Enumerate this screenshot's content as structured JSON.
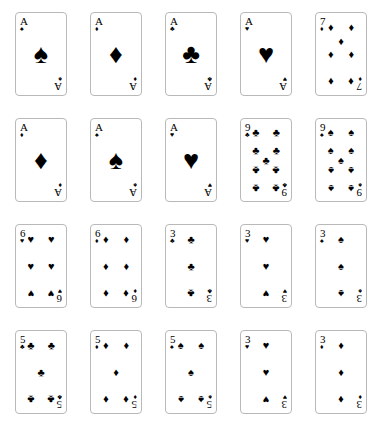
{
  "page": {
    "background_color": "#ffffff",
    "card_face_color": "#ffffff",
    "card_border_color": "#b9b9b9",
    "ink_color": "#000000",
    "rows": 4,
    "columns": 5,
    "card_count": 20
  },
  "suit_glyphs": {
    "spades": "♠",
    "hearts": "♥",
    "diamonds": "♦",
    "clubs": "♣"
  },
  "cards": [
    {
      "id": "r1c1",
      "rank": "A",
      "suit": "spades",
      "suit_glyph": "♠",
      "pip_layout": "ace",
      "row": 1,
      "column": 1
    },
    {
      "id": "r1c2",
      "rank": "A",
      "suit": "diamonds",
      "suit_glyph": "♦",
      "pip_layout": "ace",
      "row": 1,
      "column": 2
    },
    {
      "id": "r1c3",
      "rank": "A",
      "suit": "clubs",
      "suit_glyph": "♣",
      "pip_layout": "ace",
      "row": 1,
      "column": 3
    },
    {
      "id": "r1c4",
      "rank": "A",
      "suit": "hearts",
      "suit_glyph": "♥",
      "pip_layout": "ace",
      "row": 1,
      "column": 4
    },
    {
      "id": "r1c5",
      "rank": "7",
      "suit": "diamonds",
      "suit_glyph": "♦",
      "pip_layout": "seven",
      "row": 1,
      "column": 5
    },
    {
      "id": "r2c1",
      "rank": "A",
      "suit": "diamonds",
      "suit_glyph": "♦",
      "pip_layout": "ace",
      "row": 2,
      "column": 1
    },
    {
      "id": "r2c2",
      "rank": "A",
      "suit": "spades",
      "suit_glyph": "♠",
      "pip_layout": "ace",
      "row": 2,
      "column": 2
    },
    {
      "id": "r2c3",
      "rank": "A",
      "suit": "hearts",
      "suit_glyph": "♥",
      "pip_layout": "ace",
      "row": 2,
      "column": 3
    },
    {
      "id": "r2c4",
      "rank": "9",
      "suit": "clubs",
      "suit_glyph": "♣",
      "pip_layout": "nine",
      "row": 2,
      "column": 4
    },
    {
      "id": "r2c5",
      "rank": "9",
      "suit": "spades",
      "suit_glyph": "♠",
      "pip_layout": "nine",
      "row": 2,
      "column": 5
    },
    {
      "id": "r3c1",
      "rank": "6",
      "suit": "hearts",
      "suit_glyph": "♥",
      "pip_layout": "six",
      "row": 3,
      "column": 1
    },
    {
      "id": "r3c2",
      "rank": "6",
      "suit": "diamonds",
      "suit_glyph": "♦",
      "pip_layout": "six",
      "row": 3,
      "column": 2
    },
    {
      "id": "r3c3",
      "rank": "3",
      "suit": "clubs",
      "suit_glyph": "♣",
      "pip_layout": "three",
      "row": 3,
      "column": 3
    },
    {
      "id": "r3c4",
      "rank": "3",
      "suit": "hearts",
      "suit_glyph": "♥",
      "pip_layout": "three",
      "row": 3,
      "column": 4
    },
    {
      "id": "r3c5",
      "rank": "3",
      "suit": "spades",
      "suit_glyph": "♠",
      "pip_layout": "three",
      "row": 3,
      "column": 5
    },
    {
      "id": "r4c1",
      "rank": "5",
      "suit": "clubs",
      "suit_glyph": "♣",
      "pip_layout": "five",
      "row": 4,
      "column": 1
    },
    {
      "id": "r4c2",
      "rank": "5",
      "suit": "diamonds",
      "suit_glyph": "♦",
      "pip_layout": "five",
      "row": 4,
      "column": 2
    },
    {
      "id": "r4c3",
      "rank": "5",
      "suit": "spades",
      "suit_glyph": "♠",
      "pip_layout": "five",
      "row": 4,
      "column": 3
    },
    {
      "id": "r4c4",
      "rank": "3",
      "suit": "hearts",
      "suit_glyph": "♥",
      "pip_layout": "three",
      "row": 4,
      "column": 4
    },
    {
      "id": "r4c5",
      "rank": "3",
      "suit": "diamonds",
      "suit_glyph": "♦",
      "pip_layout": "three",
      "row": 4,
      "column": 5
    }
  ],
  "pip_layouts": {
    "ace": [
      {
        "x": 50,
        "y": 50,
        "size": "big",
        "flip": false
      }
    ],
    "three": [
      {
        "x": 50,
        "y": 8,
        "flip": false
      },
      {
        "x": 50,
        "y": 50,
        "flip": false
      },
      {
        "x": 50,
        "y": 92,
        "flip": true
      }
    ],
    "five": [
      {
        "x": 18,
        "y": 8,
        "flip": false
      },
      {
        "x": 82,
        "y": 8,
        "flip": false
      },
      {
        "x": 50,
        "y": 50,
        "flip": false
      },
      {
        "x": 18,
        "y": 92,
        "flip": true
      },
      {
        "x": 82,
        "y": 92,
        "flip": true
      }
    ],
    "six": [
      {
        "x": 18,
        "y": 8,
        "flip": false
      },
      {
        "x": 82,
        "y": 8,
        "flip": false
      },
      {
        "x": 18,
        "y": 50,
        "flip": false
      },
      {
        "x": 82,
        "y": 50,
        "flip": false
      },
      {
        "x": 18,
        "y": 92,
        "flip": true
      },
      {
        "x": 82,
        "y": 92,
        "flip": true
      }
    ],
    "seven": [
      {
        "x": 18,
        "y": 8,
        "flip": false
      },
      {
        "x": 82,
        "y": 8,
        "flip": false
      },
      {
        "x": 50,
        "y": 29,
        "flip": false
      },
      {
        "x": 18,
        "y": 50,
        "flip": false
      },
      {
        "x": 82,
        "y": 50,
        "flip": false
      },
      {
        "x": 18,
        "y": 92,
        "flip": true
      },
      {
        "x": 82,
        "y": 92,
        "flip": true
      }
    ],
    "nine": [
      {
        "x": 18,
        "y": 6,
        "flip": false
      },
      {
        "x": 82,
        "y": 6,
        "flip": false
      },
      {
        "x": 18,
        "y": 34,
        "flip": false
      },
      {
        "x": 82,
        "y": 34,
        "flip": false
      },
      {
        "x": 50,
        "y": 50,
        "flip": false
      },
      {
        "x": 18,
        "y": 66,
        "flip": true
      },
      {
        "x": 82,
        "y": 66,
        "flip": true
      },
      {
        "x": 18,
        "y": 94,
        "flip": true
      },
      {
        "x": 82,
        "y": 94,
        "flip": true
      }
    ]
  }
}
